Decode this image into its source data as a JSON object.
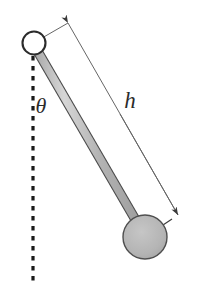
{
  "figure": {
    "name": "simple-pendulum-diagram",
    "background_color": "#ffffff",
    "width": 198,
    "height": 292
  },
  "labels": {
    "angle": "θ",
    "length": "h"
  },
  "colors": {
    "stroke": "#2b2b2b",
    "rod_fill": "#b0b0b0",
    "rod_highlight": "#d8d8d8",
    "bob_fill": "#b5b5b5",
    "pivot_fill": "#ffffff",
    "dashed_line": "#1a1a1a",
    "dimension_line": "#555555"
  },
  "geometry": {
    "pivot": {
      "cx": 34,
      "cy": 43,
      "r": 11
    },
    "bob": {
      "cx": 145,
      "cy": 237,
      "r": 22
    },
    "rod": {
      "x1": 34,
      "y1": 45,
      "x2": 141,
      "y2": 229,
      "width": 8
    },
    "vertical_dashed": {
      "x": 33,
      "y1": 56,
      "y2": 286
    },
    "dimension_line": {
      "x1": 68,
      "y1": 23,
      "x2": 178,
      "y2": 215
    },
    "bob_radius_pointer": {
      "x1": 145,
      "y1": 237,
      "x2": 178,
      "y2": 215
    },
    "pivot_connector": {
      "x1": 42,
      "y1": 38,
      "x2": 68,
      "y2": 23
    }
  },
  "label_positions": {
    "theta": {
      "x": 41,
      "y": 113
    },
    "h": {
      "x": 123,
      "y": 108
    }
  },
  "elements": {
    "pivot_name": "pivot-joint",
    "bob_name": "pendulum-bob",
    "rod_name": "pendulum-rod",
    "dashed_name": "vertical-reference-line",
    "dimension_name": "length-dimension-line"
  }
}
